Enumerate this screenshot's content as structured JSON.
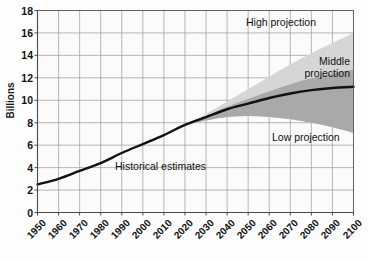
{
  "chart_data": {
    "type": "area",
    "title": "",
    "xlabel": "",
    "ylabel": "Billions",
    "xlim": [
      1950,
      2100
    ],
    "ylim": [
      0,
      18
    ],
    "ytick_step": 2,
    "xtick_step": 10,
    "grid": true,
    "legend_position": "inline-annotations",
    "x": [
      1950,
      1960,
      1970,
      1980,
      1990,
      2000,
      2010,
      2020,
      2030,
      2040,
      2050,
      2060,
      2070,
      2080,
      2090,
      2100
    ],
    "series": [
      {
        "name": "Historical estimates",
        "values": [
          2.5,
          3.0,
          3.7,
          4.4,
          5.3,
          6.1,
          6.9,
          7.8,
          null,
          null,
          null,
          null,
          null,
          null,
          null,
          null
        ]
      },
      {
        "name": "Middle projection",
        "values": [
          null,
          null,
          null,
          null,
          null,
          null,
          null,
          7.8,
          8.5,
          9.2,
          9.7,
          10.2,
          10.6,
          10.9,
          11.1,
          11.2
        ]
      },
      {
        "name": "High projection",
        "values": [
          null,
          null,
          null,
          null,
          null,
          null,
          null,
          7.8,
          8.8,
          9.9,
          11.0,
          12.1,
          13.2,
          14.2,
          15.1,
          16.0
        ]
      },
      {
        "name": "Low projection",
        "values": [
          null,
          null,
          null,
          null,
          null,
          null,
          null,
          7.8,
          8.2,
          8.5,
          8.6,
          8.5,
          8.3,
          8.0,
          7.6,
          7.1
        ]
      }
    ],
    "ytick_labels": [
      "0",
      "2",
      "4",
      "6",
      "8",
      "10",
      "12",
      "14",
      "16",
      "18"
    ],
    "xtick_labels": [
      "1950",
      "1960",
      "1970",
      "1980",
      "1990",
      "2000",
      "2010",
      "2020",
      "2030",
      "2040",
      "2050",
      "2060",
      "2070",
      "2080",
      "2090",
      "2100"
    ],
    "annotations": [
      {
        "id": "high-projection",
        "text": "High projection"
      },
      {
        "id": "middle-projection",
        "text": "Middle projection"
      },
      {
        "id": "low-projection",
        "text": "Low projection"
      },
      {
        "id": "historical-estimates",
        "text": "Historical estimates"
      }
    ],
    "colors": {
      "background": "#fdfdfd",
      "grid": "#9a9a9a",
      "axis": "#4a4a4a",
      "line": "#111111",
      "high_band": "#d6d6d6",
      "middle_band": "#a9a9a9",
      "text": "#111111"
    }
  }
}
